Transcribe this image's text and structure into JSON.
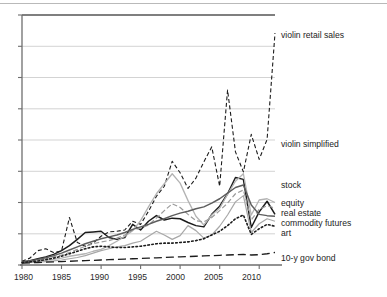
{
  "figure": {
    "background_color": "#ffffff",
    "top_rule_color": "#b9b9b9",
    "axis_color": "#6e6e6e",
    "grid_color": "#c8c8c8"
  },
  "chart_data": {
    "type": "line",
    "title": "",
    "xlabel": "",
    "ylabel": "",
    "xlim": [
      1980,
      2012
    ],
    "ylim": [
      0,
      8
    ],
    "grid": true,
    "grid_axis": "y",
    "ytick_labels_shown": false,
    "legend_position": "right-of-axes-inline",
    "x": [
      1980,
      1981,
      1982,
      1983,
      1984,
      1985,
      1986,
      1987,
      1988,
      1989,
      1990,
      1991,
      1992,
      1993,
      1994,
      1995,
      1996,
      1997,
      1998,
      1999,
      2000,
      2001,
      2002,
      2003,
      2004,
      2005,
      2006,
      2007,
      2008,
      2009,
      2010,
      2011,
      2012
    ],
    "xtick_values": [
      1980,
      1985,
      1990,
      1995,
      2000,
      2005,
      2010
    ],
    "xtick_labels": [
      "1980",
      "1985",
      "1990",
      "1995",
      "2000",
      "2005",
      "2010"
    ],
    "series": [
      {
        "name": "violin retail sales",
        "label": "violin retail sales",
        "color": "#1c1c1c",
        "style": "dashed",
        "dash": "4,2.5",
        "width": 1.1,
        "label_y": 35,
        "values": [
          0.12,
          0.22,
          0.46,
          0.52,
          0.4,
          0.45,
          1.52,
          0.72,
          0.6,
          0.7,
          0.92,
          1.06,
          1.08,
          1.12,
          1.4,
          1.3,
          1.72,
          2.2,
          2.52,
          3.32,
          2.95,
          2.45,
          2.78,
          3.3,
          3.78,
          2.52,
          5.6,
          3.62,
          2.98,
          4.18,
          3.38,
          4.02,
          7.42
        ]
      },
      {
        "name": "violin simplified",
        "label": "violin simplified",
        "color": "#1c1c1c",
        "style": "solid",
        "width": 1.5,
        "label_y": 145,
        "values": [
          0.1,
          0.14,
          0.2,
          0.26,
          0.34,
          0.46,
          0.62,
          0.82,
          1.04,
          1.06,
          1.08,
          0.88,
          0.82,
          0.88,
          1.3,
          1.12,
          1.4,
          1.58,
          1.44,
          1.5,
          1.48,
          1.36,
          1.26,
          1.22,
          1.62,
          1.88,
          2.28,
          2.8,
          2.74,
          1.2,
          1.7,
          2.04,
          1.62
        ]
      },
      {
        "name": "stock",
        "label": "stock",
        "color": "#b3b3b3",
        "style": "solid",
        "width": 1.3,
        "label_y": 186,
        "values": [
          0.08,
          0.1,
          0.12,
          0.16,
          0.18,
          0.22,
          0.28,
          0.32,
          0.36,
          0.44,
          0.5,
          0.62,
          0.76,
          0.92,
          1.1,
          1.42,
          1.86,
          2.28,
          2.6,
          2.92,
          2.62,
          2.06,
          1.56,
          1.28,
          1.6,
          1.82,
          2.26,
          2.68,
          2.92,
          1.6,
          2.08,
          2.12,
          2.0
        ]
      },
      {
        "name": "equity",
        "label": "equity",
        "color": "#9a9a9a",
        "style": "dashed",
        "dash": "5,2.5",
        "width": 1.2,
        "label_y": 204,
        "values": [
          0.09,
          0.12,
          0.16,
          0.2,
          0.26,
          0.32,
          0.4,
          0.5,
          0.6,
          0.68,
          0.74,
          0.78,
          0.86,
          0.96,
          1.12,
          1.18,
          1.28,
          1.5,
          1.74,
          1.96,
          1.84,
          1.62,
          1.42,
          1.38,
          1.52,
          1.74,
          1.98,
          2.28,
          2.4,
          1.44,
          1.78,
          1.9,
          1.82
        ]
      },
      {
        "name": "real estate",
        "label": "real estate",
        "color": "#5e5e5e",
        "style": "solid",
        "width": 1.5,
        "label_y": 214,
        "values": [
          0.1,
          0.13,
          0.18,
          0.23,
          0.3,
          0.38,
          0.48,
          0.58,
          0.68,
          0.76,
          0.84,
          0.9,
          0.96,
          1.04,
          1.14,
          1.22,
          1.3,
          1.4,
          1.48,
          1.58,
          1.66,
          1.72,
          1.8,
          1.86,
          1.98,
          2.12,
          2.3,
          2.48,
          2.56,
          1.92,
          1.62,
          1.58,
          1.56
        ]
      },
      {
        "name": "commodity futures",
        "label": "commodity futures",
        "color": "#a8a8a8",
        "style": "solid",
        "width": 1.2,
        "label_y": 224,
        "values": [
          0.07,
          0.08,
          0.09,
          0.11,
          0.13,
          0.16,
          0.2,
          0.24,
          0.3,
          0.38,
          0.46,
          0.52,
          0.58,
          0.62,
          0.7,
          0.76,
          0.92,
          1.08,
          0.96,
          0.82,
          0.94,
          1.26,
          1.1,
          0.86,
          0.96,
          1.24,
          1.6,
          2.02,
          2.22,
          1.04,
          1.32,
          1.48,
          1.4
        ]
      },
      {
        "name": "art",
        "label": "art",
        "color": "#1c1c1c",
        "style": "dotted",
        "dash": "1.6,2.4",
        "width": 1.6,
        "label_y": 233,
        "values": [
          0.08,
          0.1,
          0.13,
          0.17,
          0.22,
          0.28,
          0.36,
          0.44,
          0.52,
          0.58,
          0.6,
          0.58,
          0.56,
          0.56,
          0.58,
          0.6,
          0.64,
          0.68,
          0.7,
          0.7,
          0.72,
          0.74,
          0.78,
          0.84,
          0.96,
          1.08,
          1.26,
          1.48,
          1.6,
          0.98,
          1.16,
          1.3,
          1.24
        ]
      },
      {
        "name": "10-y gov bond",
        "label": "10-y gov bond",
        "color": "#1c1c1c",
        "style": "long-dashed",
        "dash": "8,4",
        "width": 1.3,
        "label_y": 259,
        "values": [
          0.06,
          0.07,
          0.08,
          0.09,
          0.1,
          0.11,
          0.12,
          0.13,
          0.14,
          0.15,
          0.16,
          0.17,
          0.18,
          0.19,
          0.2,
          0.21,
          0.22,
          0.23,
          0.24,
          0.25,
          0.26,
          0.27,
          0.28,
          0.29,
          0.3,
          0.31,
          0.32,
          0.33,
          0.34,
          0.32,
          0.33,
          0.36,
          0.4
        ]
      }
    ]
  }
}
